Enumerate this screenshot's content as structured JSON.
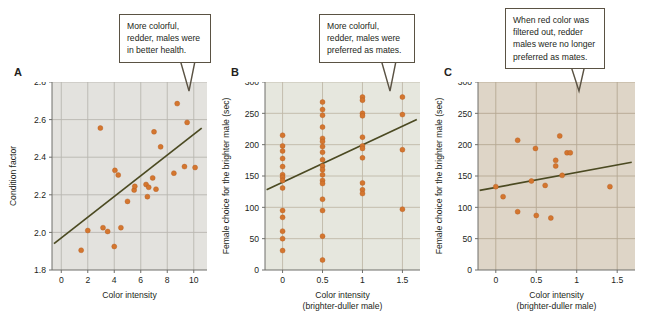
{
  "figure": {
    "background": "#ffffff",
    "point_color": "#d4762f",
    "point_edge": "#b35a1f",
    "trendline_color": "#4b4a22",
    "callout_border": "#5a5243",
    "text_color": "#231f20"
  },
  "panels": [
    {
      "letter": "A",
      "callout": "More colorful, redder, males were in better health.",
      "background": "#e3e2de",
      "gridline_color": "#b9b7b0",
      "chart_data": {
        "type": "scatter",
        "title": "",
        "xlabel": "Color intensity",
        "ylabel": "Condition factor",
        "xlim": [
          -0.7,
          11.0
        ],
        "ylim": [
          1.8,
          2.8
        ],
        "xticks": [
          0,
          2,
          4,
          6,
          8,
          10
        ],
        "yticks": [
          1.8,
          2.0,
          2.2,
          2.4,
          2.6,
          2.8
        ],
        "ytick_labels": [
          "1.8",
          "2.0",
          "2.2",
          "2.4",
          "2.6",
          "2.8"
        ],
        "xtick_labels": [
          "0",
          "2",
          "4",
          "6",
          "8",
          "10"
        ],
        "grid": true,
        "legend": "none",
        "points": [
          [
            1.5,
            1.905
          ],
          [
            2.0,
            2.01
          ],
          [
            2.95,
            2.555
          ],
          [
            3.15,
            2.025
          ],
          [
            3.5,
            2.005
          ],
          [
            4.0,
            1.925
          ],
          [
            4.05,
            2.33
          ],
          [
            4.3,
            2.305
          ],
          [
            4.5,
            2.025
          ],
          [
            5.0,
            2.165
          ],
          [
            5.5,
            2.225
          ],
          [
            5.55,
            2.245
          ],
          [
            6.4,
            2.255
          ],
          [
            6.5,
            2.19
          ],
          [
            6.6,
            2.24
          ],
          [
            6.9,
            2.29
          ],
          [
            7.0,
            2.535
          ],
          [
            7.15,
            2.23
          ],
          [
            7.5,
            2.455
          ],
          [
            8.5,
            2.315
          ],
          [
            8.75,
            2.685
          ],
          [
            9.3,
            2.35
          ],
          [
            9.5,
            2.585
          ],
          [
            10.1,
            2.345
          ]
        ],
        "trendline": {
          "x0": -0.55,
          "y0": 1.94,
          "x1": 10.6,
          "y1": 2.555
        }
      }
    },
    {
      "letter": "B",
      "callout": "More colorful, redder, males were preferred as mates.",
      "background": "#e6e7de",
      "gridline_color": "#c0b9a8",
      "chart_data": {
        "type": "scatter",
        "title": "",
        "xlabel": "Color intensity",
        "xlabel_line2": "(brighter-duller male)",
        "ylabel": "Female choice for the brighter male (sec)",
        "xlim": [
          -0.22,
          1.72
        ],
        "ylim": [
          0,
          300
        ],
        "xticks": [
          0,
          0.5,
          1,
          1.5
        ],
        "yticks": [
          0,
          50,
          100,
          150,
          200,
          250,
          300
        ],
        "xtick_labels": [
          "0",
          "0.5",
          "1",
          "1.5"
        ],
        "ytick_labels": [
          "0",
          "50",
          "100",
          "150",
          "200",
          "250",
          "300"
        ],
        "grid": true,
        "legend": "none",
        "points": [
          [
            0,
            215
          ],
          [
            0,
            198
          ],
          [
            0,
            190
          ],
          [
            0,
            178
          ],
          [
            0,
            165
          ],
          [
            0,
            152
          ],
          [
            0,
            148
          ],
          [
            0,
            143
          ],
          [
            0,
            131
          ],
          [
            0,
            95
          ],
          [
            0,
            84
          ],
          [
            0,
            62
          ],
          [
            0,
            50
          ],
          [
            0,
            31
          ],
          [
            0.5,
            268
          ],
          [
            0.5,
            256
          ],
          [
            0.5,
            247
          ],
          [
            0.5,
            228
          ],
          [
            0.5,
            210
          ],
          [
            0.5,
            205
          ],
          [
            0.5,
            197
          ],
          [
            0.5,
            188
          ],
          [
            0.5,
            176
          ],
          [
            0.5,
            166
          ],
          [
            0.5,
            160
          ],
          [
            0.5,
            152
          ],
          [
            0.5,
            143
          ],
          [
            0.5,
            138
          ],
          [
            0.5,
            113
          ],
          [
            0.5,
            95
          ],
          [
            0.5,
            54
          ],
          [
            0.5,
            16
          ],
          [
            1,
            276
          ],
          [
            1,
            271
          ],
          [
            1,
            250
          ],
          [
            1,
            246
          ],
          [
            1,
            212
          ],
          [
            1,
            198
          ],
          [
            1,
            194
          ],
          [
            1,
            179
          ],
          [
            1,
            139
          ],
          [
            1,
            128
          ],
          [
            1,
            122
          ],
          [
            1.5,
            276
          ],
          [
            1.5,
            248
          ],
          [
            1.5,
            192
          ],
          [
            1.5,
            97
          ]
        ],
        "trendline": {
          "x0": -0.2,
          "y0": 128,
          "x1": 1.68,
          "y1": 240
        }
      }
    },
    {
      "letter": "C",
      "callout": "When red color was filtered out, redder males were no longer preferred as mates.",
      "background": "#ded5c7",
      "gridline_color": "#b5a893",
      "chart_data": {
        "type": "scatter",
        "title": "",
        "xlabel": "Color intensity",
        "xlabel_line2": "(brighter-duller male)",
        "ylabel": "Female choice for the brighter male (sec)",
        "xlim": [
          -0.22,
          1.72
        ],
        "ylim": [
          0,
          300
        ],
        "xticks": [
          0,
          0.5,
          1,
          1.5
        ],
        "yticks": [
          0,
          50,
          100,
          150,
          200,
          250,
          300
        ],
        "xtick_labels": [
          "0",
          "0.5",
          "1",
          "1.5"
        ],
        "ytick_labels": [
          "0",
          "50",
          "100",
          "150",
          "200",
          "250",
          "300"
        ],
        "grid": true,
        "legend": "none",
        "points": [
          [
            0.0,
            133
          ],
          [
            0.09,
            117
          ],
          [
            0.27,
            207
          ],
          [
            0.27,
            93
          ],
          [
            0.44,
            142
          ],
          [
            0.49,
            194
          ],
          [
            0.5,
            87
          ],
          [
            0.61,
            135
          ],
          [
            0.68,
            83
          ],
          [
            0.74,
            175
          ],
          [
            0.74,
            166
          ],
          [
            0.79,
            214
          ],
          [
            0.82,
            151
          ],
          [
            0.88,
            187
          ],
          [
            0.92,
            187
          ],
          [
            1.41,
            133
          ]
        ],
        "trendline": {
          "x0": -0.2,
          "y0": 127,
          "x1": 1.68,
          "y1": 172
        }
      }
    }
  ]
}
